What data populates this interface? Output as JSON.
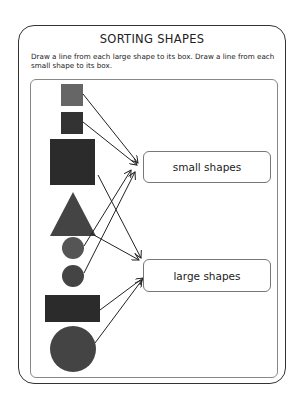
{
  "worksheet": {
    "title": "SORTING SHAPES",
    "instructions": "Draw a line from each large shape to its box.  Draw a line from each small shape to its box.",
    "boxes": [
      {
        "id": "small",
        "label": "small shapes"
      },
      {
        "id": "large",
        "label": "large shapes"
      }
    ],
    "shapes": [
      {
        "type": "square",
        "size": "small",
        "color": "#666666"
      },
      {
        "type": "square",
        "size": "small",
        "color": "#333333"
      },
      {
        "type": "square",
        "size": "large",
        "color": "#2b2b2b"
      },
      {
        "type": "triangle",
        "size": "large",
        "color": "#444444"
      },
      {
        "type": "circle",
        "size": "small",
        "color": "#555555"
      },
      {
        "type": "circle",
        "size": "small",
        "color": "#444444"
      },
      {
        "type": "rectangle",
        "size": "large",
        "color": "#2b2b2b"
      },
      {
        "type": "circle",
        "size": "large",
        "color": "#444444"
      }
    ],
    "colors": {
      "frame": "#333333",
      "inner_frame": "#888888",
      "line": "#222222"
    }
  }
}
